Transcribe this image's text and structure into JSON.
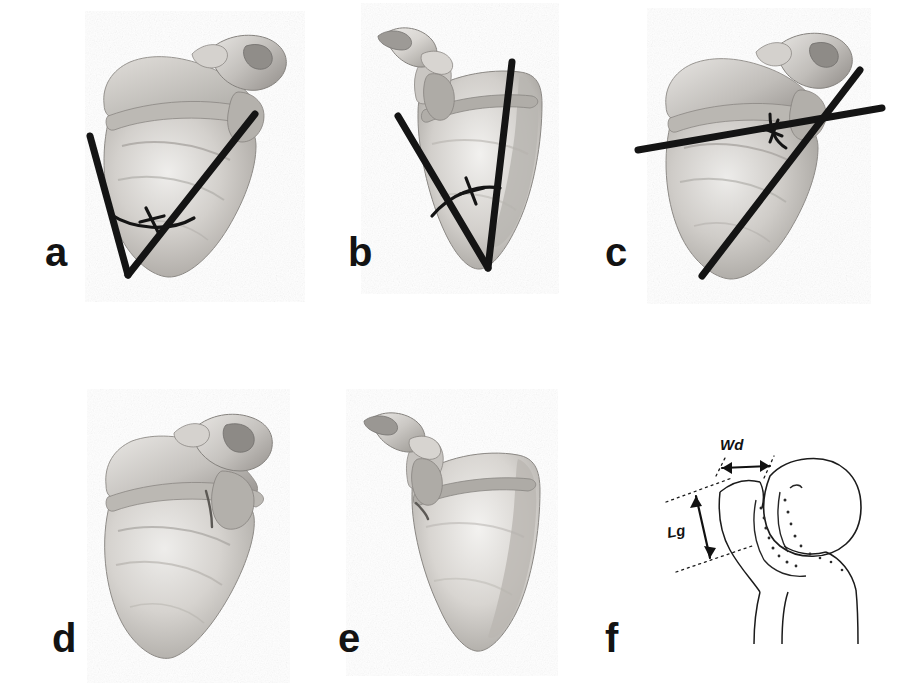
{
  "figure": {
    "type": "anatomical-specimen-plate",
    "background_color": "#ffffff",
    "line_color": "#141414",
    "bone_light": "#e3e1de",
    "bone_mid": "#c6c3bf",
    "bone_dark": "#a09d99",
    "bone_shadow": "#8a8784",
    "panel_count": 6
  },
  "panels": [
    {
      "letter": "a",
      "specimen": "scapula",
      "view": "costal-anterior-oblique",
      "annotation_type": "angle",
      "has_angle_arc": true,
      "line_count": 2,
      "description": "Scapula with two thick straight lines forming a V converging at the inferior angle; arc with tick marks the enclosed angle"
    },
    {
      "letter": "b",
      "specimen": "scapula",
      "view": "dorsal-posterior-oblique",
      "annotation_type": "angle",
      "has_angle_arc": true,
      "line_count": 2,
      "description": "Scapula with one near-vertical line along the lateral border and one oblique line along the medial border converging at the inferior angle; arc with tick marks the enclosed angle"
    },
    {
      "letter": "c",
      "specimen": "scapula",
      "view": "costal-anterior-oblique",
      "annotation_type": "angle",
      "has_angle_arc": true,
      "line_count": 2,
      "description": "Scapula with two thick lines crossing near the glenoid to form an X; small arc with tick marks the angle between them"
    },
    {
      "letter": "d",
      "specimen": "scapula",
      "view": "costal-anterior-oblique",
      "annotation_type": "none",
      "has_angle_arc": false,
      "line_count": 1,
      "description": "Unmarked scapula, same orientation as panel a, with a fine line across the scapular neck"
    },
    {
      "letter": "e",
      "specimen": "scapula",
      "view": "dorsal-posterior-oblique",
      "annotation_type": "none",
      "has_angle_arc": false,
      "line_count": 1,
      "description": "Unmarked scapula, same orientation as panel b, with a fine line at the scapular neck"
    },
    {
      "letter": "f",
      "specimen": "proximal-femur",
      "view": "anterior-line-drawing",
      "annotation_type": "dimensions",
      "has_angle_arc": false,
      "line_count": 0,
      "description": "Line drawing of a proximal femur showing a dimension width arrow and a dimension length arrow bounded by dotted guide lines"
    }
  ],
  "measurements": [
    {
      "id": "wd",
      "label": "Wd",
      "orientation": "horizontal",
      "arrow_style": "double-headed",
      "guides": "dotted",
      "panel": "f",
      "meaning": "width"
    },
    {
      "id": "lg",
      "label": "Lg",
      "orientation": "vertical",
      "arrow_style": "double-headed",
      "guides": "dotted",
      "panel": "f",
      "meaning": "length"
    }
  ]
}
